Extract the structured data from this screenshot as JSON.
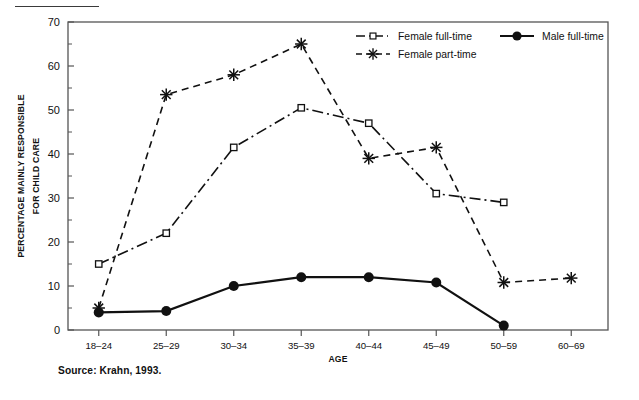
{
  "figure": {
    "source_note": "Source: Krahn, 1993.",
    "has_top_rule": true
  },
  "chart_data": {
    "type": "line",
    "title": "",
    "xlabel": "AGE",
    "ylabel_line1": "PERCENTAGE MAINLY RESPONSIBLE",
    "ylabel_line2": "FOR CHILD CARE",
    "categories": [
      "18–24",
      "25–29",
      "30–34",
      "35–39",
      "40–44",
      "45–49",
      "50–59",
      "60–69"
    ],
    "ylim": [
      0,
      70
    ],
    "yticks": [
      0,
      10,
      20,
      30,
      40,
      50,
      60,
      70
    ],
    "ytick_labels": [
      "0",
      "10",
      "20",
      "30",
      "40",
      "50",
      "60",
      "70"
    ],
    "grid": false,
    "legend_position": "top-right-inside",
    "series": [
      {
        "name": "Female full-time",
        "marker": "open-square",
        "line_style": "dash-dot",
        "color": "#111111",
        "values": [
          15,
          22,
          41.5,
          50.5,
          47,
          31,
          29,
          null
        ]
      },
      {
        "name": "Female part-time",
        "marker": "asterisk",
        "line_style": "dashed",
        "color": "#111111",
        "values": [
          5,
          53.5,
          58,
          65,
          39,
          41.5,
          10.8,
          11.8
        ]
      },
      {
        "name": "Male full-time",
        "marker": "filled-circle",
        "line_style": "solid",
        "color": "#111111",
        "values": [
          4,
          4.3,
          10,
          12,
          12,
          10.8,
          1,
          null
        ]
      }
    ]
  }
}
